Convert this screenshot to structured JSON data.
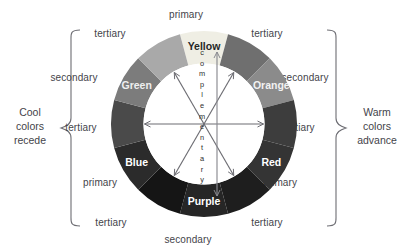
{
  "diagram": {
    "center_label": "complementary",
    "wheel": {
      "segments": [
        {
          "name": "Yellow",
          "label": "Yellow",
          "kind": "primary",
          "angle": 0,
          "fill": "#efeee4",
          "text_color": "#262626",
          "labeled": true
        },
        {
          "name": "tertiary-yellow-orange",
          "label": "",
          "kind": "tertiary",
          "angle": 30,
          "fill": "#6f6f6f",
          "text_color": "#ffffff",
          "labeled": false
        },
        {
          "name": "Orange",
          "label": "Orange",
          "kind": "secondary",
          "angle": 60,
          "fill": "#8b8b8b",
          "text_color": "#f2f2f2",
          "labeled": true
        },
        {
          "name": "tertiary-red-orange",
          "label": "",
          "kind": "tertiary",
          "angle": 90,
          "fill": "#3d3d3d",
          "text_color": "#ffffff",
          "labeled": false
        },
        {
          "name": "Red",
          "label": "Red",
          "kind": "primary",
          "angle": 120,
          "fill": "#343434",
          "text_color": "#ffffff",
          "labeled": true
        },
        {
          "name": "tertiary-red-purple",
          "label": "",
          "kind": "tertiary",
          "angle": 150,
          "fill": "#1e1e1e",
          "text_color": "#ffffff",
          "labeled": false
        },
        {
          "name": "Purple",
          "label": "Purple",
          "kind": "secondary",
          "angle": 180,
          "fill": "#262626",
          "text_color": "#ffffff",
          "labeled": true
        },
        {
          "name": "tertiary-blue-purple",
          "label": "",
          "kind": "tertiary",
          "angle": 210,
          "fill": "#151515",
          "text_color": "#ffffff",
          "labeled": false
        },
        {
          "name": "Blue",
          "label": "Blue",
          "kind": "primary",
          "angle": 240,
          "fill": "#2b2b2b",
          "text_color": "#ffffff",
          "labeled": true
        },
        {
          "name": "tertiary-blue-green",
          "label": "",
          "kind": "tertiary",
          "angle": 270,
          "fill": "#4a4a4a",
          "text_color": "#ffffff",
          "labeled": false
        },
        {
          "name": "Green",
          "label": "Green",
          "kind": "secondary",
          "angle": 300,
          "fill": "#7c7c7c",
          "text_color": "#eeeeee",
          "labeled": true
        },
        {
          "name": "tertiary-yellow-green",
          "label": "",
          "kind": "tertiary",
          "angle": 330,
          "fill": "#a9a9a9",
          "text_color": "#ffffff",
          "labeled": false
        }
      ]
    },
    "ring_labels": [
      {
        "id": "primary-top",
        "text": "primary",
        "x": 186,
        "y": 9,
        "anchor": "center"
      },
      {
        "id": "tertiary-top-left",
        "text": "tertiary",
        "x": 110,
        "y": 28,
        "anchor": "center"
      },
      {
        "id": "tertiary-top-right",
        "text": "tertiary",
        "x": 267,
        "y": 28,
        "anchor": "center"
      },
      {
        "id": "secondary-left",
        "text": "secondary",
        "x": 74,
        "y": 72,
        "anchor": "center"
      },
      {
        "id": "secondary-right",
        "text": "secondary",
        "x": 305,
        "y": 72,
        "anchor": "center"
      },
      {
        "id": "tertiary-mid-left",
        "text": "tertiary",
        "x": 81,
        "y": 122,
        "anchor": "center"
      },
      {
        "id": "tertiary-mid-right",
        "text": "tertiary",
        "x": 299,
        "y": 122,
        "anchor": "center"
      },
      {
        "id": "primary-bottom-left",
        "text": "primary",
        "x": 100,
        "y": 177,
        "anchor": "center"
      },
      {
        "id": "primary-bottom-right",
        "text": "primary",
        "x": 280,
        "y": 177,
        "anchor": "center"
      },
      {
        "id": "tertiary-bottom-left",
        "text": "tertiary",
        "x": 111,
        "y": 217,
        "anchor": "center"
      },
      {
        "id": "tertiary-bottom-right",
        "text": "tertiary",
        "x": 267,
        "y": 217,
        "anchor": "center"
      },
      {
        "id": "secondary-bottom",
        "text": "secondary",
        "x": 188,
        "y": 234,
        "anchor": "center"
      }
    ],
    "left_note": {
      "line1": "Cool",
      "line2": "colors",
      "line3": "recede"
    },
    "right_note": {
      "line1": "Warm",
      "line2": "colors",
      "line3": "advance"
    },
    "stroke_color": "#6d6d73"
  }
}
